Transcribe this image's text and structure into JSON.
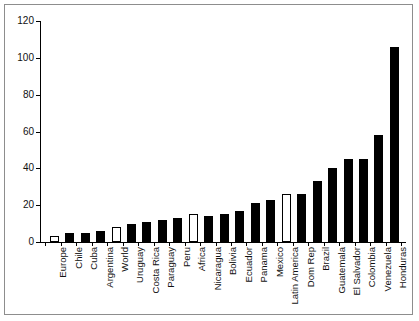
{
  "chart_data": {
    "type": "bar",
    "title": "",
    "xlabel": "",
    "ylabel": "",
    "ylim": [
      0,
      120
    ],
    "yticks": [
      0,
      20,
      40,
      60,
      80,
      100,
      120
    ],
    "grid": false,
    "legend": null,
    "categories": [
      "Europe",
      "Chile",
      "Cuba",
      "Argentina",
      "World",
      "Uruguay",
      "Costa Rica",
      "Paraguay",
      "Peru",
      "Africa",
      "Nicaragua",
      "Bolivia",
      "Ecuador",
      "Panama",
      "Mexico",
      "Latin America",
      "Dom Rep",
      "Brazil",
      "Guatemala",
      "El Salvador",
      "Colombia",
      "Venezuela",
      "Honduras"
    ],
    "values": [
      3,
      5,
      5,
      6,
      8,
      10,
      11,
      12,
      13,
      15,
      14,
      15,
      17,
      21,
      23,
      26,
      26,
      33,
      40,
      45,
      45,
      58,
      106
    ],
    "bar_styles": [
      "hollow",
      "filled",
      "filled",
      "filled",
      "hollow",
      "filled",
      "filled",
      "filled",
      "filled",
      "hollow",
      "filled",
      "filled",
      "filled",
      "filled",
      "filled",
      "hollow",
      "filled",
      "filled",
      "filled",
      "filled",
      "filled",
      "filled",
      "filled"
    ],
    "colors": {
      "filled": "#000000",
      "hollow": "#ffffff",
      "outline": "#000000",
      "axis": "#000000",
      "frame": "#8d8d8d"
    }
  }
}
